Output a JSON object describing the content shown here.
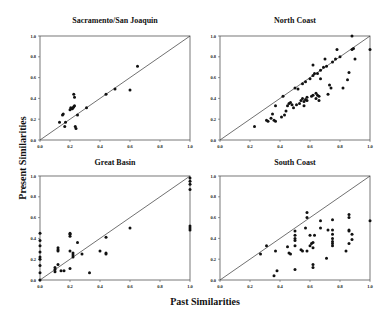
{
  "chart_data": {
    "type": "scatter",
    "xlabel": "Past Similarities",
    "ylabel": "Present Similarities",
    "panels": [
      {
        "title": "Sacramento/San Joaquin",
        "xlim": [
          0,
          1
        ],
        "ylim": [
          0,
          1
        ],
        "xticks": [
          "0.0",
          "0.2",
          "0.4",
          "0.6",
          "0.8",
          "1.0"
        ],
        "yticks": [
          "0.0",
          "0.2",
          "0.4",
          "0.6",
          "0.8",
          "1.0"
        ],
        "reference_line": "y = x",
        "points": [
          [
            0.13,
            0.17
          ],
          [
            0.15,
            0.24
          ],
          [
            0.155,
            0.25
          ],
          [
            0.165,
            0.13
          ],
          [
            0.17,
            0.17
          ],
          [
            0.2,
            0.29
          ],
          [
            0.205,
            0.31
          ],
          [
            0.215,
            0.3
          ],
          [
            0.22,
            0.31
          ],
          [
            0.225,
            0.32
          ],
          [
            0.23,
            0.33
          ],
          [
            0.225,
            0.44
          ],
          [
            0.23,
            0.41
          ],
          [
            0.235,
            0.13
          ],
          [
            0.24,
            0.11
          ],
          [
            0.25,
            0.24
          ],
          [
            0.31,
            0.31
          ],
          [
            0.44,
            0.44
          ],
          [
            0.5,
            0.49
          ],
          [
            0.6,
            0.48
          ],
          [
            0.65,
            0.71
          ]
        ]
      },
      {
        "title": "North Coast",
        "xlim": [
          0,
          1
        ],
        "ylim": [
          0,
          1
        ],
        "xticks": [
          "0.0",
          "0.2",
          "0.4",
          "0.6",
          "0.8",
          "1.0"
        ],
        "yticks": [
          "0.0",
          "0.2",
          "0.4",
          "0.6",
          "0.8",
          "1.0"
        ],
        "reference_line": "y = x",
        "points": [
          [
            0.23,
            0.13
          ],
          [
            0.31,
            0.19
          ],
          [
            0.32,
            0.18
          ],
          [
            0.34,
            0.21
          ],
          [
            0.35,
            0.25
          ],
          [
            0.36,
            0.19
          ],
          [
            0.37,
            0.18
          ],
          [
            0.37,
            0.33
          ],
          [
            0.41,
            0.22
          ],
          [
            0.42,
            0.42
          ],
          [
            0.43,
            0.24
          ],
          [
            0.44,
            0.28
          ],
          [
            0.45,
            0.33
          ],
          [
            0.46,
            0.35
          ],
          [
            0.47,
            0.36
          ],
          [
            0.48,
            0.34
          ],
          [
            0.49,
            0.31
          ],
          [
            0.5,
            0.5
          ],
          [
            0.51,
            0.34
          ],
          [
            0.52,
            0.49
          ],
          [
            0.53,
            0.35
          ],
          [
            0.54,
            0.38
          ],
          [
            0.55,
            0.4
          ],
          [
            0.55,
            0.54
          ],
          [
            0.56,
            0.37
          ],
          [
            0.56,
            0.33
          ],
          [
            0.57,
            0.39
          ],
          [
            0.57,
            0.56
          ],
          [
            0.58,
            0.38
          ],
          [
            0.58,
            0.41
          ],
          [
            0.6,
            0.59
          ],
          [
            0.61,
            0.42
          ],
          [
            0.62,
            0.43
          ],
          [
            0.62,
            0.62
          ],
          [
            0.62,
            0.72
          ],
          [
            0.63,
            0.64
          ],
          [
            0.64,
            0.4
          ],
          [
            0.64,
            0.45
          ],
          [
            0.65,
            0.43
          ],
          [
            0.65,
            0.64
          ],
          [
            0.66,
            0.42
          ],
          [
            0.66,
            0.38
          ],
          [
            0.67,
            0.59
          ],
          [
            0.67,
            0.67
          ],
          [
            0.69,
            0.7
          ],
          [
            0.7,
            0.78
          ],
          [
            0.71,
            0.71
          ],
          [
            0.72,
            0.44
          ],
          [
            0.73,
            0.53
          ],
          [
            0.74,
            0.5
          ],
          [
            0.75,
            0.75
          ],
          [
            0.77,
            0.78
          ],
          [
            0.78,
            0.87
          ],
          [
            0.8,
            0.8
          ],
          [
            0.82,
            0.5
          ],
          [
            0.85,
            0.58
          ],
          [
            0.86,
            0.65
          ],
          [
            0.88,
            0.87
          ],
          [
            0.88,
            1.0
          ],
          [
            0.89,
            0.88
          ],
          [
            0.9,
            0.78
          ],
          [
            1.0,
            0.87
          ]
        ]
      },
      {
        "title": "Great Basin",
        "xlim": [
          0,
          1
        ],
        "ylim": [
          0,
          1
        ],
        "xticks": [
          "0.0",
          "0.2",
          "0.4",
          "0.6",
          "0.8",
          "1.0"
        ],
        "yticks": [
          "0.0",
          "0.2",
          "0.4",
          "0.6",
          "0.8",
          "1.0"
        ],
        "reference_line": "y = x",
        "points": [
          [
            0.0,
            0.0
          ],
          [
            0.0,
            0.07
          ],
          [
            0.0,
            0.14
          ],
          [
            0.0,
            0.2
          ],
          [
            0.0,
            0.22
          ],
          [
            0.0,
            0.27
          ],
          [
            0.0,
            0.33
          ],
          [
            0.0,
            0.38
          ],
          [
            0.0,
            0.45
          ],
          [
            0.1,
            0.08
          ],
          [
            0.1,
            0.1
          ],
          [
            0.1,
            0.12
          ],
          [
            0.12,
            0.15
          ],
          [
            0.12,
            0.28
          ],
          [
            0.12,
            0.29
          ],
          [
            0.12,
            0.31
          ],
          [
            0.14,
            0.09
          ],
          [
            0.16,
            0.09
          ],
          [
            0.2,
            0.11
          ],
          [
            0.2,
            0.28
          ],
          [
            0.2,
            0.42
          ],
          [
            0.2,
            0.44
          ],
          [
            0.2,
            0.45
          ],
          [
            0.22,
            0.22
          ],
          [
            0.22,
            0.24
          ],
          [
            0.22,
            0.26
          ],
          [
            0.25,
            0.36
          ],
          [
            0.28,
            0.25
          ],
          [
            0.33,
            0.07
          ],
          [
            0.4,
            0.28
          ],
          [
            0.44,
            0.25
          ],
          [
            0.44,
            0.26
          ],
          [
            0.44,
            0.41
          ],
          [
            0.6,
            0.5
          ],
          [
            1.0,
            0.48
          ],
          [
            1.0,
            0.5
          ],
          [
            1.0,
            0.52
          ],
          [
            1.0,
            0.87
          ],
          [
            1.0,
            0.92
          ],
          [
            1.0,
            0.95
          ],
          [
            1.0,
            0.98
          ]
        ]
      },
      {
        "title": "South Coast",
        "xlim": [
          0,
          1
        ],
        "ylim": [
          0,
          1
        ],
        "xticks": [
          "0.0",
          "0.2",
          "0.4",
          "0.6",
          "0.8",
          "1.0"
        ],
        "yticks": [
          "0.0",
          "0.2",
          "0.4",
          "0.6",
          "0.8",
          "1.0"
        ],
        "reference_line": "y = x",
        "points": [
          [
            0.27,
            0.25
          ],
          [
            0.31,
            0.33
          ],
          [
            0.36,
            0.04
          ],
          [
            0.37,
            0.28
          ],
          [
            0.38,
            0.09
          ],
          [
            0.45,
            0.32
          ],
          [
            0.46,
            0.26
          ],
          [
            0.47,
            0.25
          ],
          [
            0.5,
            0.1
          ],
          [
            0.5,
            0.33
          ],
          [
            0.5,
            0.38
          ],
          [
            0.5,
            0.4
          ],
          [
            0.5,
            0.43
          ],
          [
            0.5,
            0.47
          ],
          [
            0.54,
            0.29
          ],
          [
            0.55,
            0.28
          ],
          [
            0.57,
            0.5
          ],
          [
            0.58,
            0.28
          ],
          [
            0.58,
            0.6
          ],
          [
            0.58,
            0.65
          ],
          [
            0.6,
            0.33
          ],
          [
            0.6,
            0.43
          ],
          [
            0.61,
            0.35
          ],
          [
            0.62,
            0.12
          ],
          [
            0.62,
            0.15
          ],
          [
            0.62,
            0.31
          ],
          [
            0.62,
            0.36
          ],
          [
            0.63,
            0.43
          ],
          [
            0.67,
            0.5
          ],
          [
            0.67,
            0.57
          ],
          [
            0.71,
            0.21
          ],
          [
            0.72,
            0.48
          ],
          [
            0.75,
            0.33
          ],
          [
            0.75,
            0.35
          ],
          [
            0.75,
            0.37
          ],
          [
            0.75,
            0.4
          ],
          [
            0.75,
            0.44
          ],
          [
            0.75,
            0.48
          ],
          [
            0.75,
            0.58
          ],
          [
            0.84,
            0.28
          ],
          [
            0.86,
            0.35
          ],
          [
            0.86,
            0.47
          ],
          [
            0.86,
            0.48
          ],
          [
            0.86,
            0.6
          ],
          [
            0.86,
            0.63
          ],
          [
            0.88,
            0.39
          ],
          [
            0.88,
            0.44
          ],
          [
            1.0,
            0.57
          ]
        ]
      }
    ]
  }
}
